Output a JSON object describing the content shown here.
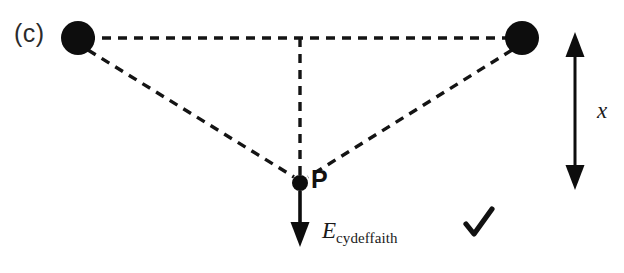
{
  "figure": {
    "panel_label": "(c)",
    "type": "physics-field-diagram",
    "background_color": "#ffffff",
    "ink_color": "#111111"
  },
  "labels": {
    "point_p": "P",
    "separation": "x",
    "field_symbol": "E",
    "field_subscript": "cydeffaith",
    "check": "✓"
  },
  "icons": {
    "check_mark": "check-mark-icon",
    "charge": "point-charge-icon",
    "field_arrow": "down-arrow-icon",
    "distance_arrow": "double-headed-arrow-icon"
  },
  "chart_data": {
    "type": "scatter",
    "title": "(c)",
    "xlabel": "",
    "ylabel": "",
    "xlim": [
      0,
      624
    ],
    "ylim": [
      273,
      0
    ],
    "grid": false,
    "legend": "none",
    "elements": {
      "charges": [
        {
          "name": "left-charge",
          "x": 78,
          "y": 38,
          "radius": 17
        },
        {
          "name": "right-charge",
          "x": 522,
          "y": 38,
          "radius": 17
        }
      ],
      "field_point": {
        "name": "point-P",
        "x": 300,
        "y": 183,
        "radius": 8,
        "label": "P"
      },
      "dashed_lines": [
        {
          "name": "top-baseline",
          "x1": 86,
          "y1": 38,
          "x2": 514,
          "y2": 38
        },
        {
          "name": "vertical-dropline",
          "x1": 300,
          "y1": 38,
          "x2": 300,
          "y2": 176
        },
        {
          "name": "left-charge-to-P",
          "x1": 88,
          "y1": 50,
          "x2": 294,
          "y2": 177
        },
        {
          "name": "right-charge-to-P",
          "x1": 512,
          "y1": 50,
          "x2": 308,
          "y2": 177
        }
      ],
      "field_arrow": {
        "name": "resultant-field-arrow",
        "x1": 300,
        "y1": 191,
        "x2": 300,
        "y2": 243,
        "direction": "down",
        "label": "E cydeffaith"
      },
      "distance_arrow": {
        "name": "separation-arrow",
        "x": 575,
        "y1": 38,
        "y2": 183,
        "heads": "both",
        "label": "x"
      },
      "check_mark": {
        "name": "check-mark",
        "x": 478,
        "y": 223
      }
    }
  }
}
